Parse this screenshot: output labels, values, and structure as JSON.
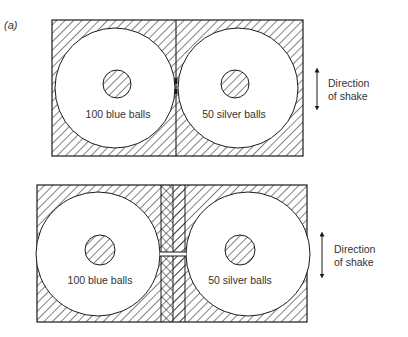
{
  "panel_label": "(a)",
  "figures": [
    {
      "id": "top",
      "left_label": "100 blue balls",
      "right_label": "50 silver balls",
      "direction_line1": "Direction",
      "direction_line2": "of shake"
    },
    {
      "id": "bottom",
      "left_label": "100 blue balls",
      "right_label": "50 silver balls",
      "direction_line1": "Direction",
      "direction_line2": "of shake"
    }
  ],
  "colors": {
    "line": "#1a1a1a",
    "text": "#333333",
    "background": "#ffffff"
  }
}
